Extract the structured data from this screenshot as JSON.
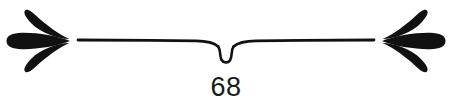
{
  "document": {
    "type": "printed-page-footer",
    "background_color": "#ffffff",
    "ink_color": "#111111"
  },
  "footer": {
    "page_number": "68",
    "page_number_color": "#1a1a1a"
  },
  "ornament": {
    "name": "typographic-divider-ornament",
    "description": "Horizontal hairline rule with a central teardrop loop knot, flanked by three-petal fan ornaments",
    "rule": {
      "name": "horizontal-rule",
      "left_x": 78,
      "right_x": 374,
      "baseline_y": 41,
      "thickness": 3
    },
    "center_knot": {
      "name": "teardrop-loop-knot",
      "center_x": 226,
      "top_y": 41,
      "bottom_y": 63,
      "width": 16
    },
    "left_fan": {
      "name": "left-petal-fan",
      "apex_x": 70,
      "apex_y": 41,
      "petals": [
        {
          "name": "upper-petal",
          "bulb_x": 29,
          "bulb_y": 12
        },
        {
          "name": "center-petal",
          "bulb_x": 9,
          "bulb_y": 41
        },
        {
          "name": "lower-petal",
          "bulb_x": 29,
          "bulb_y": 70
        }
      ]
    },
    "right_fan": {
      "name": "right-petal-fan",
      "apex_x": 382,
      "apex_y": 41,
      "petals": [
        {
          "name": "upper-petal",
          "bulb_x": 423,
          "bulb_y": 12
        },
        {
          "name": "center-petal",
          "bulb_x": 443,
          "bulb_y": 41
        },
        {
          "name": "lower-petal",
          "bulb_x": 423,
          "bulb_y": 70
        }
      ]
    }
  }
}
